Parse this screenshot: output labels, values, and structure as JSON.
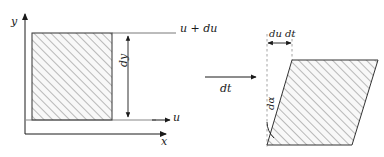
{
  "figure": {
    "background_color": "#ffffff",
    "line_color": "#1a1a1a",
    "hatch_color": "#5a5a5a",
    "fill_color": "#f7f7f7",
    "dashed_color": "#9a9a9a"
  },
  "left_panel": {
    "name": "undeformed-element",
    "axes": {
      "y_axis_label": "y",
      "x_axis_label": "x"
    },
    "velocity_labels": {
      "bottom": "u",
      "top": "u + du"
    },
    "dimension_label": "dy",
    "shape": {
      "type": "rectangle",
      "x": 32,
      "y": 33,
      "width": 80,
      "height": 87,
      "hatched": true
    }
  },
  "transition": {
    "name": "time-step-arrow",
    "label": "dt",
    "arrow": {
      "x1": 205,
      "y1": 77,
      "x2": 258,
      "y2": 77,
      "direction": "right"
    }
  },
  "right_panel": {
    "name": "deformed-element",
    "dimension_label": "du dt",
    "angle_label": "dα",
    "shape": {
      "type": "parallelogram",
      "points": "267,145 352,145 378,60 292,60",
      "hatched": true
    },
    "reference_line": {
      "type": "dashed-vertical",
      "x": 267,
      "y1": 34,
      "y2": 147
    }
  }
}
